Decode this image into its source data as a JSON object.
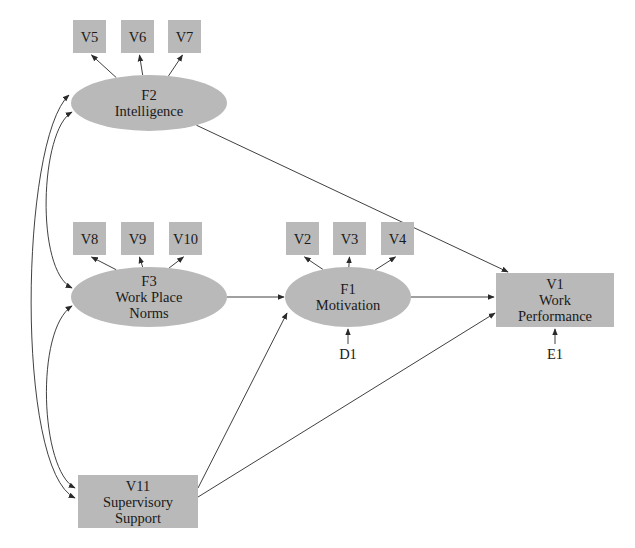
{
  "diagram": {
    "type": "structural-equation-model path diagram",
    "colors": {
      "node_fill": "#b9b9b9",
      "line": "#2a2a2a",
      "text": "#1a1a1a",
      "background": "#ffffff"
    },
    "latent_factors": [
      {
        "id": "F2",
        "lines": [
          "F2",
          "Intelligence"
        ]
      },
      {
        "id": "F3",
        "lines": [
          "F3",
          "Work Place",
          "Norms"
        ]
      },
      {
        "id": "F1",
        "lines": [
          "F1",
          "Motivation"
        ]
      }
    ],
    "observed_variables": [
      {
        "id": "V5",
        "lines": [
          "V5"
        ]
      },
      {
        "id": "V6",
        "lines": [
          "V6"
        ]
      },
      {
        "id": "V7",
        "lines": [
          "V7"
        ]
      },
      {
        "id": "V8",
        "lines": [
          "V8"
        ]
      },
      {
        "id": "V9",
        "lines": [
          "V9"
        ]
      },
      {
        "id": "V10",
        "lines": [
          "V10"
        ]
      },
      {
        "id": "V2",
        "lines": [
          "V2"
        ]
      },
      {
        "id": "V3",
        "lines": [
          "V3"
        ]
      },
      {
        "id": "V4",
        "lines": [
          "V4"
        ]
      },
      {
        "id": "V1",
        "lines": [
          "V1",
          "Work",
          "Performance"
        ]
      },
      {
        "id": "V11",
        "lines": [
          "V11",
          "Supervisory",
          "Support"
        ]
      }
    ],
    "error_terms": [
      {
        "id": "D1",
        "label": "D1",
        "target": "F1"
      },
      {
        "id": "E1",
        "label": "E1",
        "target": "V1"
      }
    ],
    "directed_paths": [
      {
        "from": "F2",
        "to": "V5"
      },
      {
        "from": "F2",
        "to": "V6"
      },
      {
        "from": "F2",
        "to": "V7"
      },
      {
        "from": "F3",
        "to": "V8"
      },
      {
        "from": "F3",
        "to": "V9"
      },
      {
        "from": "F3",
        "to": "V10"
      },
      {
        "from": "F1",
        "to": "V2"
      },
      {
        "from": "F1",
        "to": "V3"
      },
      {
        "from": "F1",
        "to": "V4"
      },
      {
        "from": "F2",
        "to": "V1"
      },
      {
        "from": "F3",
        "to": "F1"
      },
      {
        "from": "F1",
        "to": "V1"
      },
      {
        "from": "V11",
        "to": "F1"
      },
      {
        "from": "V11",
        "to": "V1"
      },
      {
        "from": "D1",
        "to": "F1"
      },
      {
        "from": "E1",
        "to": "V1"
      }
    ],
    "covariances": [
      {
        "between": [
          "F2",
          "F3"
        ]
      },
      {
        "between": [
          "F2",
          "V11"
        ]
      },
      {
        "between": [
          "F3",
          "V11"
        ]
      }
    ]
  }
}
